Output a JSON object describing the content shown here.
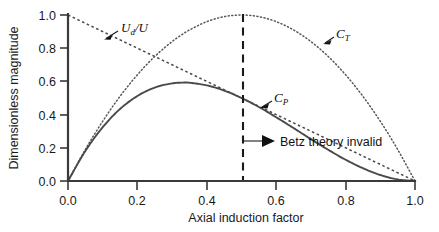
{
  "chart_data": {
    "type": "line",
    "title": "",
    "xlabel": "Axial induction factor",
    "ylabel": "Dimensionless magnitude",
    "xlim": [
      0.0,
      1.0
    ],
    "ylim": [
      0.0,
      1.0
    ],
    "grid": false,
    "legend_position": "inline-annotations",
    "xticks": [
      "0.0",
      "0.2",
      "0.4",
      "0.6",
      "0.8",
      "1.0"
    ],
    "xtick_values": [
      0.0,
      0.2,
      0.4,
      0.6,
      0.8,
      1.0
    ],
    "yticks": [
      "0.0",
      "0.2",
      "0.4",
      "0.6",
      "0.8",
      "1.0"
    ],
    "ytick_values": [
      0.0,
      0.2,
      0.4,
      0.6,
      0.8,
      1.0
    ],
    "x": [
      0.0,
      0.05,
      0.1,
      0.15,
      0.2,
      0.25,
      0.3,
      0.3333,
      0.35,
      0.4,
      0.45,
      0.5,
      0.55,
      0.6,
      0.65,
      0.7,
      0.75,
      0.8,
      0.85,
      0.9,
      0.95,
      1.0
    ],
    "series": [
      {
        "name": "C_P",
        "label": "CP",
        "style": "solid",
        "formula": "4a(1-a)^2",
        "values": [
          0.0,
          0.181,
          0.324,
          0.434,
          0.512,
          0.563,
          0.588,
          0.593,
          0.592,
          0.576,
          0.545,
          0.5,
          0.446,
          0.384,
          0.319,
          0.252,
          0.188,
          0.128,
          0.077,
          0.036,
          0.0095,
          0.0
        ]
      },
      {
        "name": "C_T",
        "label": "CT",
        "style": "dotted",
        "formula": "4a(1-a)",
        "values": [
          0.0,
          0.19,
          0.36,
          0.51,
          0.64,
          0.75,
          0.84,
          0.889,
          0.91,
          0.96,
          0.99,
          1.0,
          0.99,
          0.96,
          0.91,
          0.84,
          0.75,
          0.64,
          0.51,
          0.36,
          0.19,
          0.0
        ]
      },
      {
        "name": "U_d/U",
        "label": "Ud/U",
        "style": "dashed",
        "formula": "1-a",
        "values": [
          1.0,
          0.95,
          0.9,
          0.85,
          0.8,
          0.75,
          0.7,
          0.6667,
          0.65,
          0.6,
          0.55,
          0.5,
          0.45,
          0.4,
          0.35,
          0.3,
          0.25,
          0.2,
          0.15,
          0.1,
          0.05,
          0.0
        ]
      }
    ],
    "annotations": [
      {
        "name": "betz-invalid-annotation",
        "text": "Betz theory invalid",
        "at_x": 0.5,
        "type": "arrow-right-from-vertical-line"
      },
      {
        "name": "betz-limit-vline",
        "text": "",
        "at_x": 0.5,
        "type": "vertical-dashed-line"
      }
    ]
  },
  "labels": {
    "ud_over_u_main": "U",
    "ud_over_u_sub": "d",
    "ud_over_u_tail": "/U",
    "ct_main": "C",
    "ct_sub": "T",
    "cp_main": "C",
    "cp_sub": "P",
    "betz_note": "Betz theory invalid",
    "xaxis_title": "Axial induction factor",
    "yaxis_title": "Dimensionless magnitude"
  },
  "axes": {
    "x_ticks": [
      "0.0",
      "0.2",
      "0.4",
      "0.6",
      "0.8",
      "1.0"
    ],
    "y_ticks": [
      "0.0",
      "0.2",
      "0.4",
      "0.6",
      "0.8",
      "1.0"
    ]
  },
  "colors": {
    "axis": "#3a3a3a",
    "curve_cp": "#4a4a4a",
    "curve_ct": "#565656",
    "curve_ud": "#4a4a4a",
    "betz_line": "#1a1a1a",
    "text": "#111111",
    "background": "#ffffff"
  }
}
